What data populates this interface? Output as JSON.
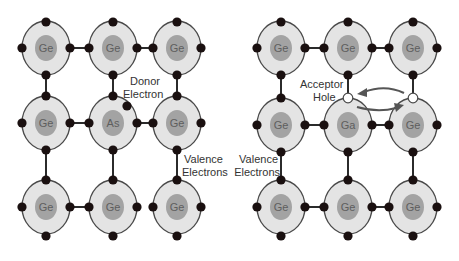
{
  "colors": {
    "background": "#ffffff",
    "shell_fill": "#e4e4e4",
    "nucleus_fill": "#a3a3a3",
    "electron_fill": "#1a1010",
    "bond": "#2b2b2b",
    "arrow": "#555555"
  },
  "panels": [
    {
      "name": "n-type",
      "atoms": [
        [
          "Ge",
          "Ge",
          "Ge"
        ],
        [
          "Ge",
          "As",
          "Ge"
        ],
        [
          "Ge",
          "Ge",
          "Ge"
        ]
      ],
      "labels": {
        "donor_line1": "Donor",
        "donor_line2": "Electron",
        "valence_line1": "Valence",
        "valence_line2": "Electrons"
      }
    },
    {
      "name": "p-type",
      "atoms": [
        [
          "Ge",
          "Ge",
          "Ge"
        ],
        [
          "Ge",
          "Ga",
          "Ge"
        ],
        [
          "Ge",
          "Ge",
          "Ge"
        ]
      ],
      "labels": {
        "acceptor_line1": "Acceptor",
        "acceptor_line2": "Hole",
        "valence_line1": "Valence",
        "valence_line2": "Electrons"
      }
    }
  ]
}
